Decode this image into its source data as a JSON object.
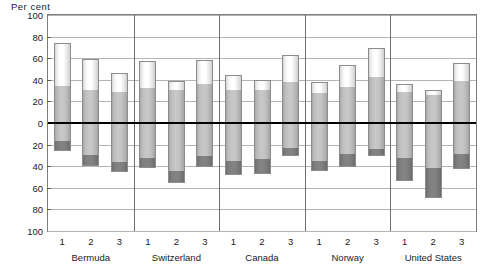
{
  "chart_data": {
    "type": "bar",
    "title": "",
    "subtitle": "",
    "ylabel": "Per cent",
    "xlabel": "",
    "stacked": true,
    "orientation": "vertical",
    "grid": true,
    "legend_position": "none",
    "baseline": 0,
    "ylim": [
      -100,
      100
    ],
    "ytick_labels": [
      "100",
      "80",
      "60",
      "40",
      "20",
      "0",
      "20",
      "40",
      "60",
      "80",
      "100"
    ],
    "ytick_values": [
      100,
      80,
      60,
      40,
      20,
      0,
      -20,
      -40,
      -60,
      -80,
      -100
    ],
    "groups": [
      "Bermuda",
      "Switzerland",
      "Canada",
      "Norway",
      "United States"
    ],
    "bar_labels": [
      "1",
      "2",
      "3"
    ],
    "categories": [
      "Bermuda 1",
      "Bermuda 2",
      "Bermuda 3",
      "Switzerland 1",
      "Switzerland 2",
      "Switzerland 3",
      "Canada 1",
      "Canada 2",
      "Canada 3",
      "Norway 1",
      "Norway 2",
      "Norway 3",
      "United States 1",
      "United States 2",
      "United States 3"
    ],
    "series": [
      {
        "name": "upper-light",
        "color": "#ffffff",
        "values": [
          40,
          28,
          17,
          25,
          8,
          22,
          13,
          9,
          25,
          10,
          21,
          26,
          7,
          5,
          17
        ]
      },
      {
        "name": "upper-mid",
        "color": "#c2c2c2",
        "values": [
          34,
          31,
          29,
          32,
          31,
          36,
          31,
          31,
          38,
          28,
          33,
          43,
          29,
          26,
          39
        ]
      },
      {
        "name": "lower-mid",
        "color": "#c2c2c2",
        "values": [
          -17,
          -30,
          -36,
          -32,
          -44,
          -31,
          -35,
          -33,
          -23,
          -35,
          -29,
          -24,
          -32,
          -42,
          -29
        ]
      },
      {
        "name": "lower-dark",
        "color": "#7d7d7d",
        "values": [
          -9,
          -10,
          -9,
          -10,
          -12,
          -10,
          -13,
          -14,
          -8,
          -9,
          -12,
          -7,
          -22,
          -27,
          -14
        ]
      }
    ],
    "totals_positive": [
      74,
      59,
      46,
      57,
      39,
      58,
      44,
      40,
      63,
      38,
      54,
      69,
      36,
      31,
      56
    ],
    "totals_negative": [
      -26,
      -40,
      -45,
      -42,
      -56,
      -41,
      -48,
      -47,
      -31,
      -44,
      -41,
      -31,
      -54,
      -69,
      -43
    ]
  },
  "accessibility": {
    "chart_description": "Stacked vertical bar chart with positive and negative segments around a zero baseline, grouped by country"
  }
}
